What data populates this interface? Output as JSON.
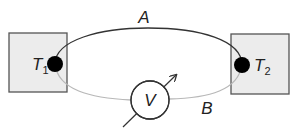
{
  "diagram": {
    "wire_a": {
      "label": "A",
      "color": "#333333"
    },
    "wire_b": {
      "label": "B",
      "color": "#b8b8b8"
    },
    "junction_1": {
      "label": "T",
      "subscript": "1"
    },
    "junction_2": {
      "label": "T",
      "subscript": "2"
    },
    "voltmeter": {
      "label": "V"
    },
    "colors": {
      "box_fill": "#ececec",
      "box_stroke": "#555555",
      "junction": "#000000"
    }
  }
}
